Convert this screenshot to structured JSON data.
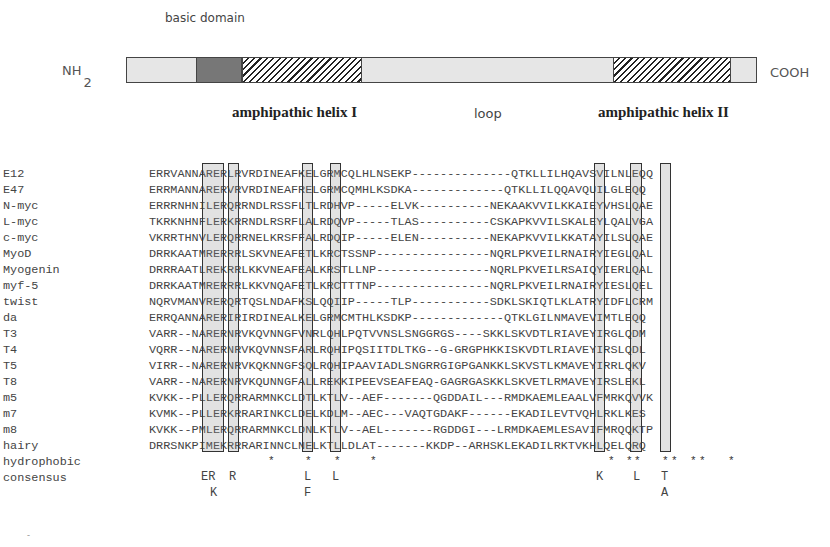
{
  "diagram": {
    "basic_label": "basic domain",
    "nterm_label": "NH",
    "nterm_sub": "2",
    "cterm_label": "COOH",
    "helix1_label": "amphipathic helix I",
    "loop_label": "loop",
    "helix2_label": "amphipathic helix II",
    "segments": [
      {
        "type": "light",
        "width": 69
      },
      {
        "type": "dark",
        "width": 46
      },
      {
        "type": "hatch",
        "width": 121
      },
      {
        "type": "light",
        "width": 252
      },
      {
        "type": "hatch",
        "width": 118
      },
      {
        "type": "light",
        "width": 25
      }
    ]
  },
  "alignment": {
    "rows": [
      {
        "name": "E12",
        "seq": "ERRVANNARERLRVRDINEAFKELGRMCQLHLNSEKP--------------QTKLLILHQAVSVILNLEQQ"
      },
      {
        "name": "E47",
        "seq": "ERRMANNARERVRVRDINEAFRELGRMCQMHLKSDKA-------------QTKLLILQQAVQUILGLEQQ"
      },
      {
        "name": "N-myc",
        "seq": "ERRRNHNILERQRRNDLRSSFLTLRDHVP-----ELVK----------NEKAAKVVILKKAIEYVHSLQAE"
      },
      {
        "name": "L-myc",
        "seq": "TKRKNHNFLERKRRNDLRSRFLALRDQVP-----TLAS----------CSKAPKVVILSKALEYLQALVGA"
      },
      {
        "name": "c-myc",
        "seq": "VKRRTHNVLERQRRNELKRSFFALRDQIP-----ELEN----------NEKAPKVVILKKATAYILSUQAE"
      },
      {
        "name": "MyoD",
        "seq": "DRRKAATMRERRRLSKVNEAFETLKRCTSSNP----------------NQRLPKVEILRNAIRYIEGLQAL"
      },
      {
        "name": "Myogenin",
        "seq": "DRRRAATLREKRRLKKVNEAFEALKRSTLLNP----------------NQRLPKVEILRSAIQYIERLQAL"
      },
      {
        "name": "myf-5",
        "seq": "DRRKAATMRERRRLKKVNQAFETLKRCTTTNP----------------NQRLPKVEILRNAIRYIESLQEL"
      },
      {
        "name": "twist",
        "seq": "NQRVMANVRERQRTQSLNDAFKSLQQIIP-----TLP-----------SDKLSKIQTLKLATRYIDFLCRM"
      },
      {
        "name": "da",
        "seq": "ERRQANNARERIRIRDINEALKELGRMCMTHLKSDKP-------------QTKLGILNMAVEVIMTLEQQ"
      },
      {
        "name": "T3",
        "seq": "VARR--NARERNRVKQVNNGFVNRLQHLPQTVVNSLSNGGRGS----SKKLSKVDTLRIAVEYIRGLQDM"
      },
      {
        "name": "T4",
        "seq": "VQRR--NARERNRVKQVNNSFARLRQHIPQSIITDLTKG--G-GRGPHKKISKVDTLRIAVEYIRSLQDL"
      },
      {
        "name": "T5",
        "seq": "VIRR--NARERNRVKQKNNGFSQLRQHIPAAVIADLSNGRRGIGPGANKKLSKVSTLKMAVEYIRRLQKV"
      },
      {
        "name": "T8",
        "seq": "VARR--NARERNRVKQUNNGFALLREKKIPEEVSEAFEAQ-GAGRGASKKLSKVETLRMAVEYIRSLEKL"
      },
      {
        "name": "m5",
        "seq": "KVKK--PLLERQRRARMNKCLDTLKTLV--AEF-------QGDDAIL---RMDKAEMLEAALVFMRKQVVK"
      },
      {
        "name": "m7",
        "seq": "KVMK--PLLERKRRARINKCLDELKDLM--AEC---VAQTGDAKF------EKADILEVTVQHLRKLKES"
      },
      {
        "name": "m8",
        "seq": "KVKK--PMLERQRRARMNKCLDNLKTLV--AEL-------RGDDGI---LRMDKAEMLESAVIFMRQQKTP"
      },
      {
        "name": "hairy",
        "seq": "DRRSNKPIMEKRRRARINNCLNELKTLLDLAT-------KKDP--ARHSKLEKADILRKTVKHLQELQRQ"
      }
    ],
    "hydrophobic_label": "hydrophobic",
    "consensus_label": "consensus",
    "hydrophobic_stars": [
      {
        "x": 268,
        "s": "*"
      },
      {
        "x": 305,
        "s": "*"
      },
      {
        "x": 334,
        "s": "*"
      },
      {
        "x": 370,
        "s": "*"
      },
      {
        "x": 608,
        "s": "*"
      },
      {
        "x": 626,
        "s": "*"
      },
      {
        "x": 634,
        "s": "*"
      },
      {
        "x": 662,
        "s": "*"
      },
      {
        "x": 671,
        "s": "*"
      },
      {
        "x": 690,
        "s": "*"
      },
      {
        "x": 699,
        "s": "*"
      },
      {
        "x": 728,
        "s": "*"
      }
    ],
    "consensus_top": [
      {
        "x": 201,
        "s": "ER"
      },
      {
        "x": 229,
        "s": "R"
      },
      {
        "x": 304,
        "s": "L"
      },
      {
        "x": 332,
        "s": "L"
      },
      {
        "x": 596,
        "s": "K"
      },
      {
        "x": 633,
        "s": "L"
      },
      {
        "x": 661,
        "s": "T"
      }
    ],
    "consensus_bottom": [
      {
        "x": 210,
        "s": "K"
      },
      {
        "x": 304,
        "s": "F"
      },
      {
        "x": 661,
        "s": "A"
      }
    ]
  },
  "footer": {
    "tick": "-"
  }
}
